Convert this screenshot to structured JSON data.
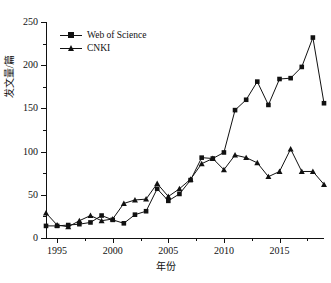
{
  "chart_data": {
    "type": "line",
    "title": "",
    "xlabel": "年份",
    "ylabel": "发文量/篇",
    "xlim": [
      1994,
      2019
    ],
    "ylim": [
      0,
      250
    ],
    "ytick_labels": [
      "0",
      "50",
      "100",
      "150",
      "200",
      "250"
    ],
    "ytick_values": [
      0,
      50,
      100,
      150,
      200,
      250
    ],
    "ytick_minor_values": [
      25,
      75,
      125,
      175,
      225
    ],
    "xtick_labels": [
      "1995",
      "2000",
      "2005",
      "2010",
      "2015"
    ],
    "xtick_values": [
      1995,
      2000,
      2005,
      2010,
      2015
    ],
    "xtick_minor_values": [
      1997.5,
      2002.5,
      2007.5,
      2012.5,
      2017.5
    ],
    "grid": false,
    "legend_position": "upper-left",
    "x": [
      1994,
      1995,
      1996,
      1997,
      1998,
      1999,
      2000,
      2001,
      2002,
      2003,
      2004,
      2005,
      2006,
      2007,
      2008,
      2009,
      2010,
      2011,
      2012,
      2013,
      2014,
      2015,
      2016,
      2017,
      2018,
      2019
    ],
    "series": [
      {
        "name": "Web of Science",
        "marker": "square",
        "color": "#111111",
        "values": [
          14,
          14,
          15,
          16,
          18,
          26,
          21,
          17,
          27,
          31,
          57,
          43,
          51,
          67,
          93,
          92,
          99,
          96,
          93,
          87,
          77,
          103,
          77,
          76,
          62,
          62
        ]
      },
      {
        "name": "CNKI",
        "marker": "triangle",
        "color": "#111111",
        "values": [
          29,
          15,
          13,
          20,
          26,
          20,
          22,
          40,
          44,
          45,
          63,
          48,
          57,
          68,
          86,
          79,
          148,
          160,
          181,
          154,
          184,
          185,
          198,
          232,
          156,
          156
        ]
      }
    ],
    "wos_values": [
      14,
      14,
      15,
      16,
      18,
      26,
      21,
      17,
      27,
      31,
      57,
      43,
      51,
      67,
      93,
      92,
      99,
      148,
      160,
      181,
      154,
      184,
      185,
      198,
      232,
      156
    ],
    "cnki_values": [
      29,
      15,
      13,
      20,
      26,
      20,
      22,
      40,
      44,
      45,
      63,
      48,
      57,
      68,
      86,
      92,
      79,
      96,
      93,
      87,
      71,
      77,
      103,
      77,
      77,
      62
    ]
  },
  "legend": {
    "items": [
      {
        "label": "Web of Science",
        "marker": "square-marker"
      },
      {
        "label": "CNKI",
        "marker": "triangle-marker"
      }
    ]
  }
}
